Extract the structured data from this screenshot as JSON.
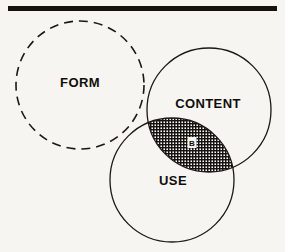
{
  "figure": {
    "type": "venn-diagram",
    "background_color": "#f7f5f1",
    "ink_color": "#100e0c",
    "rule": {
      "name": "top-rule",
      "present": true,
      "color": "#151210",
      "x_start": 8,
      "x_end": 277,
      "y": 6,
      "thickness": 5
    },
    "circles": [
      {
        "id": "form",
        "label": "FORM",
        "stroke_style": "dashed",
        "stroke_color": "#1a1714",
        "stroke_width": 1.6,
        "dash_pattern": "9 6",
        "fill": "none",
        "cx": 80,
        "cy": 85,
        "r": 64,
        "label_x": 80,
        "label_y": 87
      },
      {
        "id": "content",
        "label": "CONTENT",
        "stroke_style": "solid",
        "stroke_color": "#1a1714",
        "stroke_width": 1.3,
        "fill": "none",
        "cx": 209,
        "cy": 110,
        "r": 62,
        "label_x": 208,
        "label_y": 108
      },
      {
        "id": "use",
        "label": "USE",
        "stroke_style": "solid",
        "stroke_color": "#1a1714",
        "stroke_width": 1.3,
        "fill": "none",
        "cx": 172,
        "cy": 180,
        "r": 62,
        "label_x": 173,
        "label_y": 185
      }
    ],
    "intersections": [
      {
        "id": "content-use-lens",
        "members": [
          "content",
          "use"
        ],
        "label": "B",
        "fill_pattern": "cross-hatch",
        "fill_density": "fine",
        "label_x": 192,
        "label_y": 143,
        "label_chip_fill": "#f5f3ef",
        "label_chip_w": 9,
        "label_chip_h": 11
      }
    ],
    "labels": {
      "form": "FORM",
      "content": "CONTENT",
      "use": "USE",
      "lens_b": "B"
    }
  }
}
